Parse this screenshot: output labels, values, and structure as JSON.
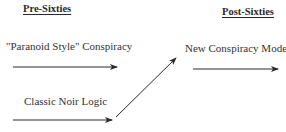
{
  "diagram": {
    "columns": [
      {
        "id": "pre",
        "heading": "Pre-Sixties"
      },
      {
        "id": "post",
        "heading": "Post-Sixties"
      }
    ],
    "nodes": [
      {
        "id": "paranoid",
        "label": "\"Paranoid Style\" Conspiracy",
        "column": "pre"
      },
      {
        "id": "noir",
        "label": "Classic Noir Logic",
        "column": "pre"
      },
      {
        "id": "new",
        "label": "New Conspiracy Model",
        "column": "post"
      }
    ],
    "edges": [
      {
        "from": "paranoid",
        "to": "",
        "description": "horizontal arrow pointing right"
      },
      {
        "from": "noir",
        "to": "",
        "description": "horizontal arrow pointing right"
      },
      {
        "from": "noir",
        "to": "new",
        "description": "diagonal arrow pointing up-right"
      },
      {
        "from": "new",
        "to": "",
        "description": "horizontal arrow pointing right"
      }
    ],
    "colors": {
      "arrow": "#2a2a2a",
      "text": "#2a2a2a",
      "background": "#ffffff"
    }
  }
}
